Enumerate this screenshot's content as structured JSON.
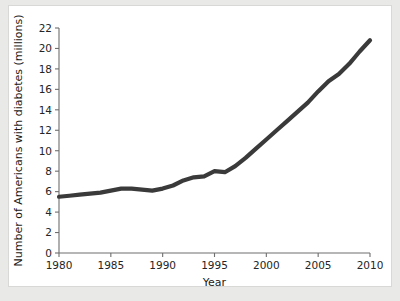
{
  "chart_data": {
    "type": "line",
    "title": "",
    "xlabel": "Year",
    "ylabel": "Number of Americans with diabetes (millions)",
    "xlim": [
      1980,
      2010
    ],
    "ylim": [
      0,
      22
    ],
    "grid": false,
    "legend": null,
    "xticks": [
      1980,
      1985,
      1990,
      1995,
      2000,
      2005,
      2010
    ],
    "xtick_labels": [
      "1980",
      "1985",
      "1990",
      "1995",
      "2000",
      "2005",
      "2010"
    ],
    "yticks": [
      0,
      2,
      4,
      6,
      8,
      10,
      12,
      14,
      16,
      18,
      20,
      22
    ],
    "ytick_labels": [
      "0",
      "2",
      "4",
      "6",
      "8",
      "10",
      "12",
      "14",
      "16",
      "18",
      "20",
      "22"
    ],
    "line_color": "#3a3a3a",
    "panel_background": "#ffffff",
    "figure_background": "#e9e9e7",
    "axis_color": "#6e6e6e",
    "series": [
      {
        "name": "Americans with diabetes",
        "x": [
          1980,
          1981,
          1982,
          1983,
          1984,
          1985,
          1986,
          1987,
          1988,
          1989,
          1990,
          1991,
          1992,
          1993,
          1994,
          1995,
          1996,
          1997,
          1998,
          1999,
          2000,
          2001,
          2002,
          2003,
          2004,
          2005,
          2006,
          2007,
          2008,
          2009,
          2010
        ],
        "values": [
          5.5,
          5.6,
          5.7,
          5.8,
          5.9,
          6.1,
          6.3,
          6.3,
          6.2,
          6.1,
          6.3,
          6.6,
          7.1,
          7.4,
          7.5,
          8.0,
          7.9,
          8.5,
          9.3,
          10.2,
          11.1,
          12.0,
          12.9,
          13.8,
          14.7,
          15.8,
          16.8,
          17.5,
          18.5,
          19.7,
          20.8
        ]
      }
    ]
  }
}
